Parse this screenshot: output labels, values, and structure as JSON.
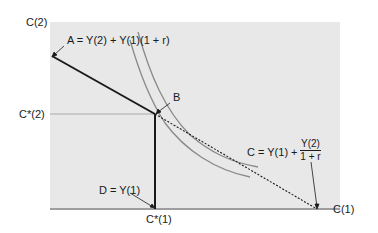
{
  "diagram": {
    "type": "intertemporal-consumption-choice",
    "axes": {
      "y_label": "C(2)",
      "x_label": "C(1)"
    },
    "tick_labels": {
      "c_star_2": "C*(2)",
      "c_star_1": "C*(1)"
    },
    "points": {
      "A": {
        "label": "A",
        "equation": "A = Y(2) + Y(1)(1 + r)"
      },
      "B": {
        "label": "B"
      },
      "C": {
        "equation_prefix": "C = Y(1) + ",
        "fraction_numerator": "Y(2)",
        "fraction_denominator": "1 + r"
      },
      "D": {
        "label": "D",
        "equation": "D = Y(1)"
      }
    },
    "elements": [
      {
        "name": "budget-constraint-solid",
        "style": "solid",
        "from": "A",
        "to": "B"
      },
      {
        "name": "endowment-vertical",
        "style": "solid",
        "from": "B",
        "to": "D"
      },
      {
        "name": "budget-extension-dotted",
        "style": "dotted",
        "from": "B",
        "to": "C"
      },
      {
        "name": "indifference-curve-outer",
        "style": "solid-gray"
      },
      {
        "name": "indifference-curve-inner",
        "style": "solid-gray"
      },
      {
        "name": "guide-line-c-star-2",
        "style": "thin-gray"
      }
    ],
    "colors": {
      "panel": "#e8e8e8",
      "ink": "#1a1a1a",
      "curve": "#8a8a8a",
      "guide": "#9a9a9a"
    }
  }
}
